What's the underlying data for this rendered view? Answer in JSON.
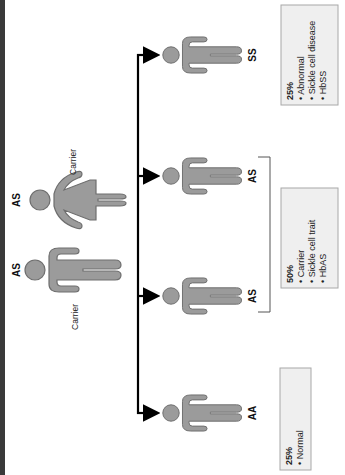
{
  "parents": [
    {
      "genotype": "AS",
      "status": "Carrier",
      "sex": "female"
    },
    {
      "genotype": "AS",
      "status": "Carrier",
      "sex": "male"
    }
  ],
  "children": [
    {
      "genotype": "SS"
    },
    {
      "genotype": "AS"
    },
    {
      "genotype": "AS"
    },
    {
      "genotype": "AA"
    }
  ],
  "outcome_boxes": [
    {
      "percent": "25%",
      "bullets": [
        "Abnormal",
        "Sickle cell disease",
        "HbSS"
      ]
    },
    {
      "percent": "50%",
      "bullets": [
        "Carrier",
        "Sickle cell trait",
        "HbAS"
      ]
    },
    {
      "percent": "25%",
      "bullets": [
        "Normal"
      ]
    }
  ],
  "colors": {
    "figure_fill": "#9b9b9b",
    "figure_stroke": "#6e6e6e",
    "box_fill": "#efefef",
    "box_stroke": "#a8a8a8",
    "line": "#000000"
  }
}
